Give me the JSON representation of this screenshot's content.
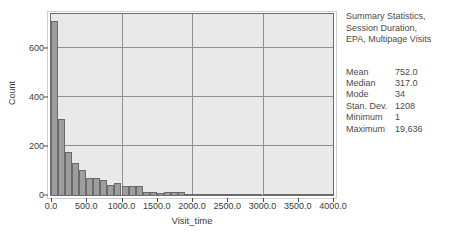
{
  "figure": {
    "background": "#ffffff",
    "plot_background": "#e9e9e9",
    "bar_color": "#9d9d9d",
    "bar_edge_color": "#6a6a6a",
    "grid_color": "#8f8f8f",
    "axis_color": "#4a4a4a"
  },
  "side_panel": {
    "title_lines": [
      "Summary Statistics,",
      "Session Duration,",
      "EPA, Multipage Visits"
    ],
    "stats": [
      {
        "label": "Mean",
        "value": "752.0"
      },
      {
        "label": "Median",
        "value": "317.0"
      },
      {
        "label": "Mode",
        "value": "34"
      },
      {
        "label": "Stan. Dev.",
        "value": "1208"
      },
      {
        "label": "Minimum",
        "value": "1"
      },
      {
        "label": "Maximum",
        "value": "19,636"
      }
    ]
  },
  "chart_data": {
    "type": "bar",
    "title": "",
    "xlabel": "Visit_time",
    "ylabel": "Count",
    "xlim": [
      0,
      4000
    ],
    "ylim": [
      0,
      740
    ],
    "grid": true,
    "legend": null,
    "xticks": [
      "0.0",
      "500.0",
      "1000.0",
      "1500.0",
      "2000.0",
      "2500.0",
      "3000.0",
      "3500.0",
      "4000.0"
    ],
    "xtick_values": [
      0,
      500,
      1000,
      1500,
      2000,
      2500,
      3000,
      3500,
      4000
    ],
    "yticks": [
      "0",
      "200",
      "400",
      "600"
    ],
    "ytick_values": [
      0,
      200,
      400,
      600
    ],
    "bin_width": 100,
    "bin_starts": [
      0,
      100,
      200,
      300,
      400,
      500,
      600,
      700,
      800,
      900,
      1000,
      1100,
      1200,
      1300,
      1400,
      1500,
      1600,
      1700,
      1800,
      1900,
      2000,
      2100,
      2200,
      2300,
      2400,
      2500,
      2600,
      2700,
      2800,
      2900,
      3000,
      3100,
      3200,
      3300,
      3400,
      3500,
      3600,
      3700,
      3800,
      3900
    ],
    "categories": [
      "0",
      "100",
      "200",
      "300",
      "400",
      "500",
      "600",
      "700",
      "800",
      "900",
      "1000",
      "1100",
      "1200",
      "1300",
      "1400",
      "1500",
      "1600",
      "1700",
      "1800",
      "1900",
      "2000",
      "2100",
      "2200",
      "2300",
      "2400",
      "2500",
      "2600",
      "2700",
      "2800",
      "2900",
      "3000",
      "3100",
      "3200",
      "3300",
      "3400",
      "3500",
      "3600",
      "3700",
      "3800",
      "3900"
    ],
    "values": [
      710,
      310,
      175,
      130,
      103,
      68,
      68,
      60,
      42,
      50,
      35,
      36,
      35,
      14,
      14,
      9,
      11,
      12,
      12,
      5,
      4,
      4,
      3,
      3,
      2,
      2,
      2,
      1,
      1,
      1,
      1,
      1,
      1,
      1,
      1,
      1,
      1,
      1,
      1,
      1
    ]
  }
}
